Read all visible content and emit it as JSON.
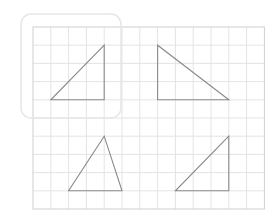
{
  "canvas": {
    "width": 280,
    "height": 224,
    "background": "#ffffff"
  },
  "grid": {
    "origin_x": 33,
    "origin_y": 27,
    "cols": 13,
    "rows": 10,
    "cell_w": 17.8,
    "cell_h": 18.2,
    "line_color": "#e4e4e4",
    "border_color": "#cfcfcf"
  },
  "selection_box": {
    "x": 21,
    "y": 14,
    "width": 100,
    "height": 104,
    "radius": 10,
    "stroke": "#e6e6e6"
  },
  "triangles": [
    {
      "id": "triangle-1",
      "label": "top-left right triangle",
      "points": [
        [
          4,
          1
        ],
        [
          1,
          4
        ],
        [
          4,
          4
        ]
      ],
      "selected": true
    },
    {
      "id": "triangle-2",
      "label": "top-right right triangle",
      "points": [
        [
          7,
          1
        ],
        [
          7,
          4
        ],
        [
          11,
          4
        ]
      ],
      "selected": false
    },
    {
      "id": "triangle-3",
      "label": "bottom-left scalene triangle",
      "points": [
        [
          4,
          6
        ],
        [
          2,
          9
        ],
        [
          5,
          9
        ]
      ],
      "selected": false
    },
    {
      "id": "triangle-4",
      "label": "bottom-right right triangle",
      "points": [
        [
          11,
          6
        ],
        [
          8,
          9
        ],
        [
          11,
          9
        ]
      ],
      "selected": false
    }
  ],
  "triangle_style": {
    "stroke": "#8a8a8a",
    "stroke_width": 1.1,
    "fill": "none"
  }
}
